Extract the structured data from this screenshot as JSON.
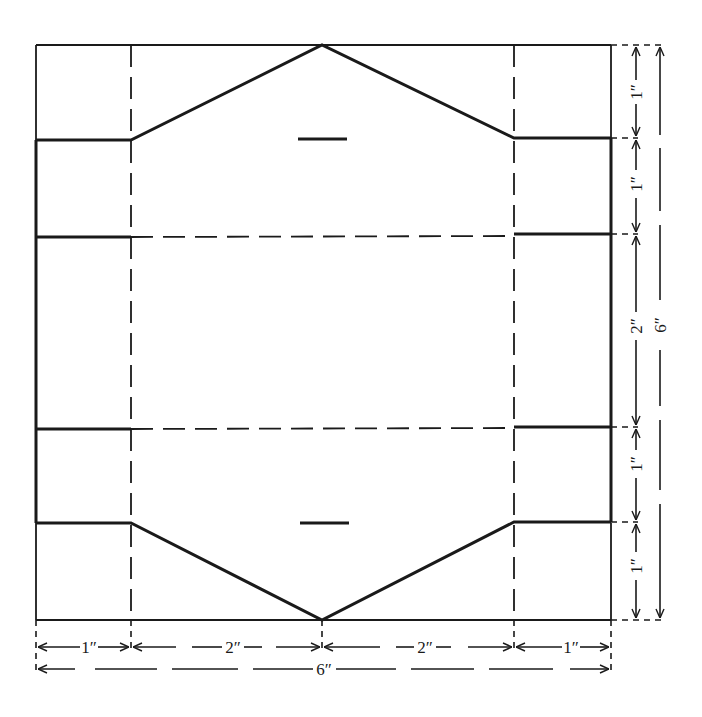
{
  "diagram": {
    "type": "box-template-net",
    "colors": {
      "line": "#1a1a1a",
      "background": "#ffffff"
    },
    "line_legend": {
      "solid_thick": "cut line",
      "solid_thin": "outline",
      "dashed": "fold line"
    },
    "slots": [
      {
        "id": "top-slot",
        "note": "short horizontal slot near top point"
      },
      {
        "id": "bottom-slot",
        "note": "short horizontal slot near bottom point"
      }
    ]
  },
  "dimensions": {
    "right_inner": [
      {
        "label": "1″",
        "segment": "top flap"
      },
      {
        "label": "1″",
        "segment": "upper side"
      },
      {
        "label": "2″",
        "segment": "center panel"
      },
      {
        "label": "1″",
        "segment": "lower side"
      },
      {
        "label": "1″",
        "segment": "bottom flap"
      }
    ],
    "right_outer": {
      "label": "6″",
      "segment": "total height"
    },
    "bottom_inner": [
      {
        "label": "1″",
        "segment": "left panel"
      },
      {
        "label": "2″",
        "segment": "left-center panel"
      },
      {
        "label": "2″",
        "segment": "right-center panel"
      },
      {
        "label": "1″",
        "segment": "right panel"
      }
    ],
    "bottom_outer": {
      "label": "6″",
      "segment": "total width"
    }
  }
}
